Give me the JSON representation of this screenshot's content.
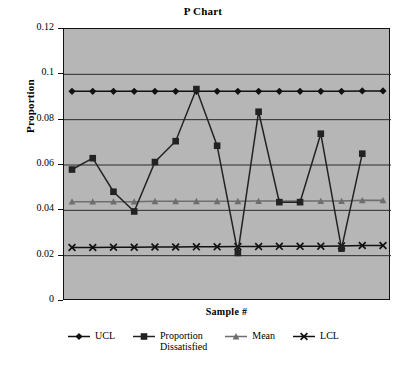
{
  "chart_data": {
    "type": "line",
    "title": "P Chart",
    "xlabel": "Sample #",
    "ylabel": "Proportion",
    "ylim": [
      0,
      0.12
    ],
    "ytick_labels": [
      "0",
      "0.02",
      "0.04",
      "0.06",
      "0.08",
      "0.1",
      "0.12"
    ],
    "ytick_values": [
      0,
      0.02,
      0.04,
      0.06,
      0.08,
      0.1,
      0.12
    ],
    "xtick_labels": [],
    "grid": "horizontal",
    "legend_position": "bottom",
    "plot_background": "#b6b6b6",
    "figure_background": "#ffffff",
    "n_samples": 16,
    "x": [
      1,
      2,
      3,
      4,
      5,
      6,
      7,
      8,
      9,
      10,
      11,
      12,
      13,
      14,
      15,
      16
    ],
    "series": [
      {
        "name": "UCL",
        "marker": "diamond",
        "color": "#111111",
        "values": [
          0.0925,
          0.0925,
          0.0925,
          0.0925,
          0.0925,
          0.0925,
          0.0925,
          0.0925,
          0.0925,
          0.0925,
          0.0925,
          0.0925,
          0.0925,
          0.0925,
          0.0927,
          0.0927
        ]
      },
      {
        "name": "Proportion Dissatisfied",
        "marker": "square",
        "color": "#222222",
        "values": [
          0.058,
          0.063,
          0.0482,
          0.0395,
          0.0613,
          0.0705,
          0.0935,
          0.0685,
          0.0212,
          0.0835,
          0.0436,
          0.0436,
          0.0738,
          0.0231,
          0.065,
          null
        ]
      },
      {
        "name": "Mean",
        "marker": "triangle",
        "color": "#6e6e6e",
        "values": [
          0.0438,
          0.0438,
          0.0438,
          0.0438,
          0.044,
          0.044,
          0.044,
          0.044,
          0.044,
          0.0441,
          0.0441,
          0.0441,
          0.0441,
          0.0441,
          0.0444,
          0.0444
        ]
      },
      {
        "name": "LCL",
        "marker": "x",
        "color": "#111111",
        "values": [
          0.0236,
          0.0236,
          0.0237,
          0.0237,
          0.0238,
          0.0238,
          0.0239,
          0.0239,
          0.024,
          0.024,
          0.0241,
          0.0241,
          0.0242,
          0.0243,
          0.0245,
          0.0245
        ]
      }
    ],
    "legend": [
      {
        "label": "UCL",
        "marker": "diamond",
        "color": "#111111"
      },
      {
        "label": "Proportion\nDissatisfied",
        "marker": "square",
        "color": "#222222"
      },
      {
        "label": "Mean",
        "marker": "triangle",
        "color": "#6e6e6e"
      },
      {
        "label": "LCL",
        "marker": "x",
        "color": "#111111"
      }
    ]
  }
}
